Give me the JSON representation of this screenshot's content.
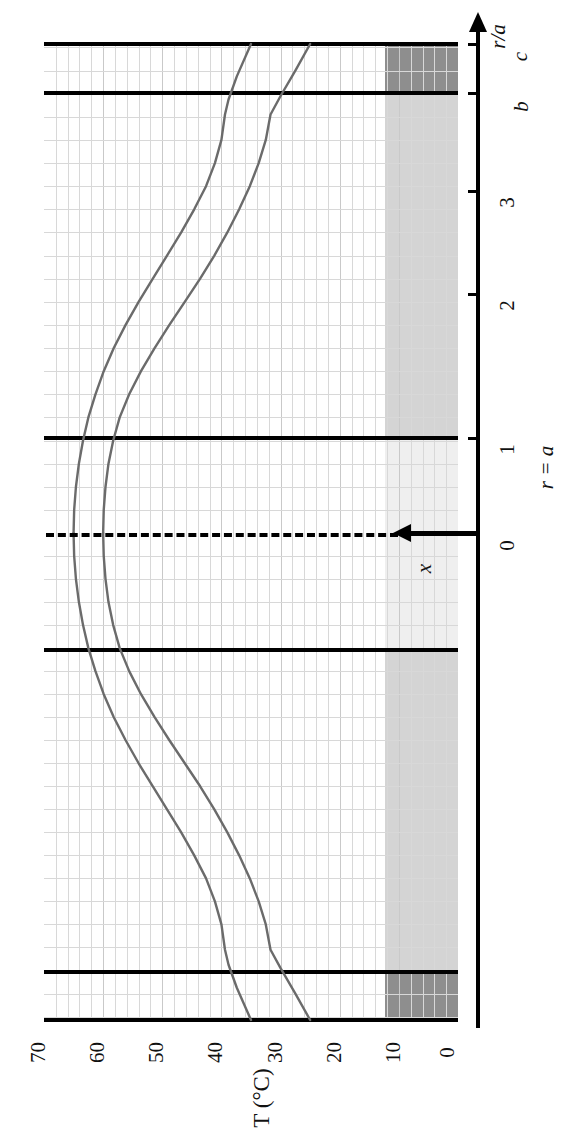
{
  "figure": {
    "orientation": "rotated-90-ccw",
    "background": "#ffffff"
  },
  "axes": {
    "temperature": {
      "title": "T (°C)",
      "unit": "°C",
      "ticks": [
        "70",
        "60",
        "50",
        "40",
        "30",
        "20",
        "10",
        "0"
      ],
      "range_high": 70,
      "range_low": 0,
      "minor_step": 2
    },
    "radius": {
      "title": "r/a",
      "ticks": [
        "0",
        "1",
        "2",
        "3",
        "b",
        "c"
      ],
      "special_label": "r = a",
      "italic_ticks": [
        "b",
        "c"
      ]
    }
  },
  "annotations": {
    "x_arrow_label": "x",
    "r_equals_a": "r = a",
    "axis_title_ra": "r/a",
    "tick_b": "b",
    "tick_c": "c",
    "tick_0": "0",
    "tick_1": "1",
    "tick_2": "2",
    "tick_3": "3"
  },
  "colors": {
    "curve": "#6b6b6b",
    "frame": "#000000",
    "grid": "#d8d8d8",
    "shade_light": "#d4d4d4",
    "shade_dark": "#8e8e8e",
    "background": "#ffffff"
  },
  "chart_data": {
    "type": "line",
    "title": "",
    "xlabel": "T (°C)",
    "ylabel": "r/a",
    "xlim": [
      0,
      70
    ],
    "ylim": [
      -4.3,
      4.3
    ],
    "grid": true,
    "legend": "none",
    "note": "Radial temperature profile across a composite cylinder; symmetric about r = 0 (dashed centerline). Region |r/a| < 1 is the core, 1 < |r/a| < b is the light-shaded annulus, b < |r/a| < c is the dark-shaded outer shell.",
    "interfaces": {
      "r_over_a_core": 1.0,
      "r_over_a_b": 3.62,
      "r_over_a_c": 4.23
    },
    "series": [
      {
        "name": "profile-1",
        "comment": "upper/hotter profile, peak ~65 C at centerline",
        "points": [
          [
            65.0,
            0.0
          ],
          [
            64.9,
            0.2
          ],
          [
            64.6,
            0.4
          ],
          [
            64.1,
            0.6
          ],
          [
            63.4,
            0.8
          ],
          [
            62.5,
            1.0
          ],
          [
            61.3,
            1.2
          ],
          [
            59.9,
            1.4
          ],
          [
            58.2,
            1.6
          ],
          [
            56.2,
            1.8
          ],
          [
            54.0,
            2.0
          ],
          [
            51.6,
            2.2
          ],
          [
            49.2,
            2.4
          ],
          [
            46.8,
            2.6
          ],
          [
            44.6,
            2.8
          ],
          [
            42.6,
            3.0
          ],
          [
            41.1,
            3.2
          ],
          [
            40.0,
            3.4
          ],
          [
            39.4,
            3.62
          ],
          [
            38.8,
            3.75
          ],
          [
            37.4,
            3.95
          ],
          [
            35.0,
            4.23
          ]
        ]
      },
      {
        "name": "profile-2",
        "comment": "lower/cooler profile, peak ~60 C at centerline",
        "points": [
          [
            60.0,
            0.0
          ],
          [
            59.9,
            0.2
          ],
          [
            59.6,
            0.4
          ],
          [
            59.1,
            0.6
          ],
          [
            58.3,
            0.8
          ],
          [
            57.2,
            1.0
          ],
          [
            55.6,
            1.2
          ],
          [
            53.6,
            1.4
          ],
          [
            51.3,
            1.6
          ],
          [
            48.8,
            1.8
          ],
          [
            46.2,
            2.0
          ],
          [
            43.6,
            2.2
          ],
          [
            41.2,
            2.4
          ],
          [
            39.0,
            2.6
          ],
          [
            37.0,
            2.8
          ],
          [
            35.2,
            3.0
          ],
          [
            33.7,
            3.2
          ],
          [
            32.5,
            3.4
          ],
          [
            31.7,
            3.62
          ],
          [
            30.0,
            3.78
          ],
          [
            27.5,
            4.0
          ],
          [
            25.0,
            4.23
          ]
        ]
      }
    ]
  }
}
